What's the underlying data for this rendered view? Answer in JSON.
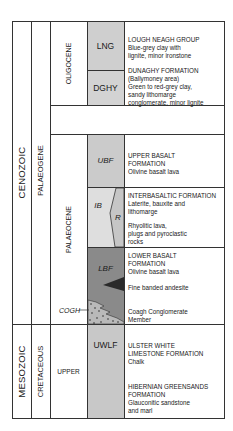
{
  "diagram": {
    "type": "stratigraphic-column",
    "colors": {
      "border": "#333333",
      "lng_fill": "#cfcfcf",
      "dghy_fill": "#d3d3d3",
      "ubf_fill": "#cbcbcb",
      "ib_fill": "#dedede",
      "rhyolite_fill": "#c6c6c6",
      "lbf_fill": "#8a8a8a",
      "andesite_fill": "#2a2a2a",
      "uwlf_fill": "#c8c8c8"
    },
    "eras": [
      {
        "label": "CENOZOIC"
      },
      {
        "label": "MESOZOIC"
      }
    ],
    "periods": [
      {
        "label": "PALAEOGENE"
      },
      {
        "label": "CRETACEOUS"
      }
    ],
    "epochs": [
      {
        "label": "OLIGOCENE"
      },
      {
        "label": "PALAEOCENE"
      },
      {
        "label": "UPPER"
      }
    ],
    "units": [
      {
        "code": "LNG"
      },
      {
        "code": "DGHY"
      },
      {
        "code": "UBF"
      },
      {
        "code": "IB"
      },
      {
        "code": "R"
      },
      {
        "code": "LBF"
      },
      {
        "code": "COGH"
      },
      {
        "code": "UWLF"
      }
    ],
    "descriptions": {
      "lng": [
        "LOUGH NEAGH GROUP",
        "Blue-grey clay with",
        "lignite, minor ironstone"
      ],
      "dghy": [
        "DUNAGHY FORMATION",
        "(Ballymoney area)",
        "Green to red-grey clay,",
        "sandy lithomarge",
        "conglomerate, minor lignite"
      ],
      "ubf": [
        "UPPER BASALT",
        "FORMATION",
        "Olivine basalt lava"
      ],
      "ib": [
        "INTERBASALTIC FORMATION",
        "Laterite, bauxite and",
        "lithomarge"
      ],
      "r": [
        "Rhyolitic lava,",
        "plugs and pyroclastic",
        "rocks"
      ],
      "lbf": [
        "LOWER BASALT",
        "FORMATION",
        "Olivine basalt lava"
      ],
      "andesite": [
        "Fine banded andesite"
      ],
      "cogh": [
        "Coagh Conglomerate",
        "Member"
      ],
      "uwlf": [
        "ULSTER WHITE",
        "LIMESTONE FORMATION",
        "Chalk"
      ],
      "hibernian": [
        "HIBERNIAN GREENSANDS",
        "FORMATION",
        "Glauconitic sandstone",
        "and marl"
      ]
    }
  }
}
